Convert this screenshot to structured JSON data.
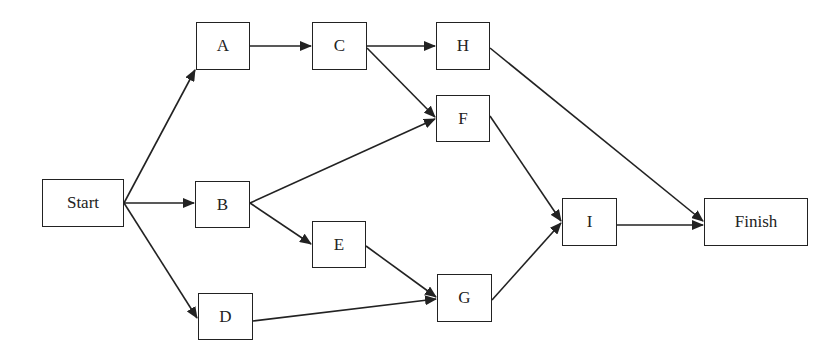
{
  "diagram": {
    "type": "activity-network",
    "nodes": [
      {
        "id": "start",
        "label": "Start",
        "x": 42,
        "y": 179,
        "w": 82,
        "h": 48
      },
      {
        "id": "a",
        "label": "A",
        "x": 196,
        "y": 22,
        "w": 54,
        "h": 48
      },
      {
        "id": "b",
        "label": "B",
        "x": 195,
        "y": 181,
        "w": 55,
        "h": 47
      },
      {
        "id": "c",
        "label": "C",
        "x": 312,
        "y": 22,
        "w": 55,
        "h": 48
      },
      {
        "id": "d",
        "label": "D",
        "x": 198,
        "y": 293,
        "w": 55,
        "h": 47
      },
      {
        "id": "e",
        "label": "E",
        "x": 312,
        "y": 221,
        "w": 54,
        "h": 47
      },
      {
        "id": "f",
        "label": "F",
        "x": 436,
        "y": 95,
        "w": 54,
        "h": 47
      },
      {
        "id": "g",
        "label": "G",
        "x": 437,
        "y": 274,
        "w": 55,
        "h": 48
      },
      {
        "id": "h",
        "label": "H",
        "x": 436,
        "y": 22,
        "w": 54,
        "h": 48
      },
      {
        "id": "i",
        "label": "I",
        "x": 562,
        "y": 198,
        "w": 55,
        "h": 48
      },
      {
        "id": "finish",
        "label": "Finish",
        "x": 704,
        "y": 198,
        "w": 104,
        "h": 48
      }
    ],
    "edges": [
      {
        "from": "start",
        "to": "a",
        "x1": 124,
        "y1": 203,
        "x2": 195,
        "y2": 70
      },
      {
        "from": "start",
        "to": "b",
        "x1": 124,
        "y1": 203,
        "x2": 194,
        "y2": 203
      },
      {
        "from": "start",
        "to": "d",
        "x1": 124,
        "y1": 203,
        "x2": 197,
        "y2": 318
      },
      {
        "from": "a",
        "to": "c",
        "x1": 250,
        "y1": 46,
        "x2": 311,
        "y2": 46
      },
      {
        "from": "c",
        "to": "h",
        "x1": 367,
        "y1": 46,
        "x2": 435,
        "y2": 46
      },
      {
        "from": "c",
        "to": "f",
        "x1": 367,
        "y1": 48,
        "x2": 435,
        "y2": 117
      },
      {
        "from": "b",
        "to": "f",
        "x1": 250,
        "y1": 203,
        "x2": 435,
        "y2": 119
      },
      {
        "from": "b",
        "to": "e",
        "x1": 250,
        "y1": 203,
        "x2": 311,
        "y2": 244
      },
      {
        "from": "e",
        "to": "g",
        "x1": 366,
        "y1": 246,
        "x2": 436,
        "y2": 297
      },
      {
        "from": "d",
        "to": "g",
        "x1": 253,
        "y1": 321,
        "x2": 436,
        "y2": 299
      },
      {
        "from": "h",
        "to": "finish",
        "x1": 490,
        "y1": 48,
        "x2": 703,
        "y2": 221
      },
      {
        "from": "f",
        "to": "i",
        "x1": 490,
        "y1": 116,
        "x2": 561,
        "y2": 221
      },
      {
        "from": "g",
        "to": "i",
        "x1": 492,
        "y1": 300,
        "x2": 561,
        "y2": 223
      },
      {
        "from": "i",
        "to": "finish",
        "x1": 617,
        "y1": 225,
        "x2": 703,
        "y2": 225
      }
    ],
    "colors": {
      "stroke": "#222222",
      "fill": "#ffffff",
      "text": "#222222"
    }
  }
}
